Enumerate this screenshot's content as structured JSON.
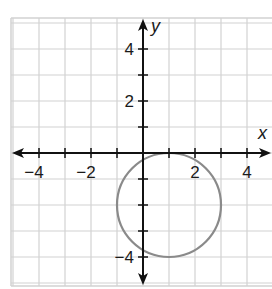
{
  "chart_data": {
    "type": "scatter",
    "title": "",
    "xlabel": "x",
    "ylabel": "y",
    "xlim": [
      -5,
      5
    ],
    "ylim": [
      -5,
      5
    ],
    "grid": true,
    "grid_step": 1,
    "x_tick_labels": [
      {
        "value": -4,
        "label": "−4"
      },
      {
        "value": -2,
        "label": "−2"
      },
      {
        "value": 2,
        "label": "2"
      },
      {
        "value": 4,
        "label": "4"
      }
    ],
    "y_tick_labels": [
      {
        "value": 4,
        "label": "4"
      },
      {
        "value": 2,
        "label": "2"
      },
      {
        "value": -4,
        "label": "−4"
      }
    ],
    "shapes": [
      {
        "shape": "circle",
        "center": [
          1,
          -2
        ],
        "radius": 2,
        "equation": "(x - 1)^2 + (y + 2)^2 = 4"
      }
    ],
    "colors": {
      "grid": "#d2d2d2",
      "axes": "#111111",
      "circle": "#8a8a8a"
    }
  }
}
